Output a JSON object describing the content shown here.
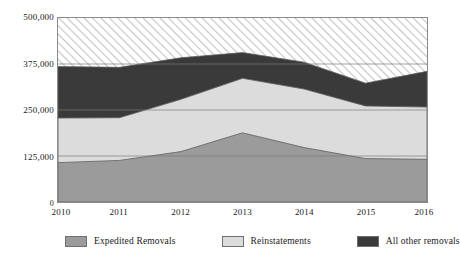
{
  "chart_data": {
    "type": "area",
    "stacked": true,
    "title": "",
    "subtitle": "",
    "xlabel": "",
    "ylabel": "",
    "x": [
      2010,
      2011,
      2012,
      2013,
      2014,
      2015,
      2016
    ],
    "categories": [
      "2010",
      "2011",
      "2012",
      "2013",
      "2014",
      "2015",
      "2016"
    ],
    "xtick_labels": [
      "2010",
      "2011",
      "2012",
      "2013",
      "2014",
      "2015",
      "2016"
    ],
    "ytick_labels": [
      "0",
      "125,000",
      "250,000",
      "375,000",
      "500,000"
    ],
    "ytick_values": [
      0,
      125000,
      250000,
      375000,
      500000
    ],
    "ylim": [
      0,
      500000
    ],
    "xlim": [
      2010,
      2016
    ],
    "grid": true,
    "grid_axis": "y",
    "legend_position": "bottom",
    "series": [
      {
        "name": "Expedited Removals",
        "color": "#9b9b9b",
        "values": [
          107000,
          113000,
          137000,
          188000,
          148000,
          118000,
          116000
        ]
      },
      {
        "name": "Reinstatements",
        "color": "#dcdcdc",
        "values": [
          121000,
          116000,
          142000,
          148000,
          159000,
          143000,
          142000
        ]
      },
      {
        "name": "All other removals",
        "color": "#3a3a3a",
        "values": [
          140000,
          137000,
          113000,
          70000,
          73000,
          62000,
          97000
        ]
      }
    ],
    "stack_tops": {
      "expedited_removals": [
        107000,
        113000,
        137000,
        188000,
        148000,
        118000,
        116000
      ],
      "plus_reinstatements": [
        228000,
        229000,
        279000,
        336000,
        307000,
        261000,
        258000
      ],
      "plus_all_other_removals": [
        368000,
        366000,
        392000,
        406000,
        380000,
        323000,
        355000
      ]
    },
    "hatched_region": {
      "label": "unfilled area above stacked total",
      "pattern": "diagonal-hatch",
      "color": "#c8c8c8"
    },
    "annotations": []
  },
  "legend": {
    "items": [
      {
        "label": "Expedited Removals",
        "color": "#9b9b9b"
      },
      {
        "label": "Reinstatements",
        "color": "#dcdcdc"
      },
      {
        "label": "All other removals",
        "color": "#3a3a3a"
      }
    ]
  },
  "colors": {
    "expedited": "#9b9b9b",
    "reinstatements": "#dcdcdc",
    "all_other": "#3a3a3a",
    "hatch": "#c8c8c8",
    "frame": "#8a8a8a",
    "gridline": "#7a7a7a",
    "text": "#1a1a1a",
    "background": "#ffffff"
  }
}
